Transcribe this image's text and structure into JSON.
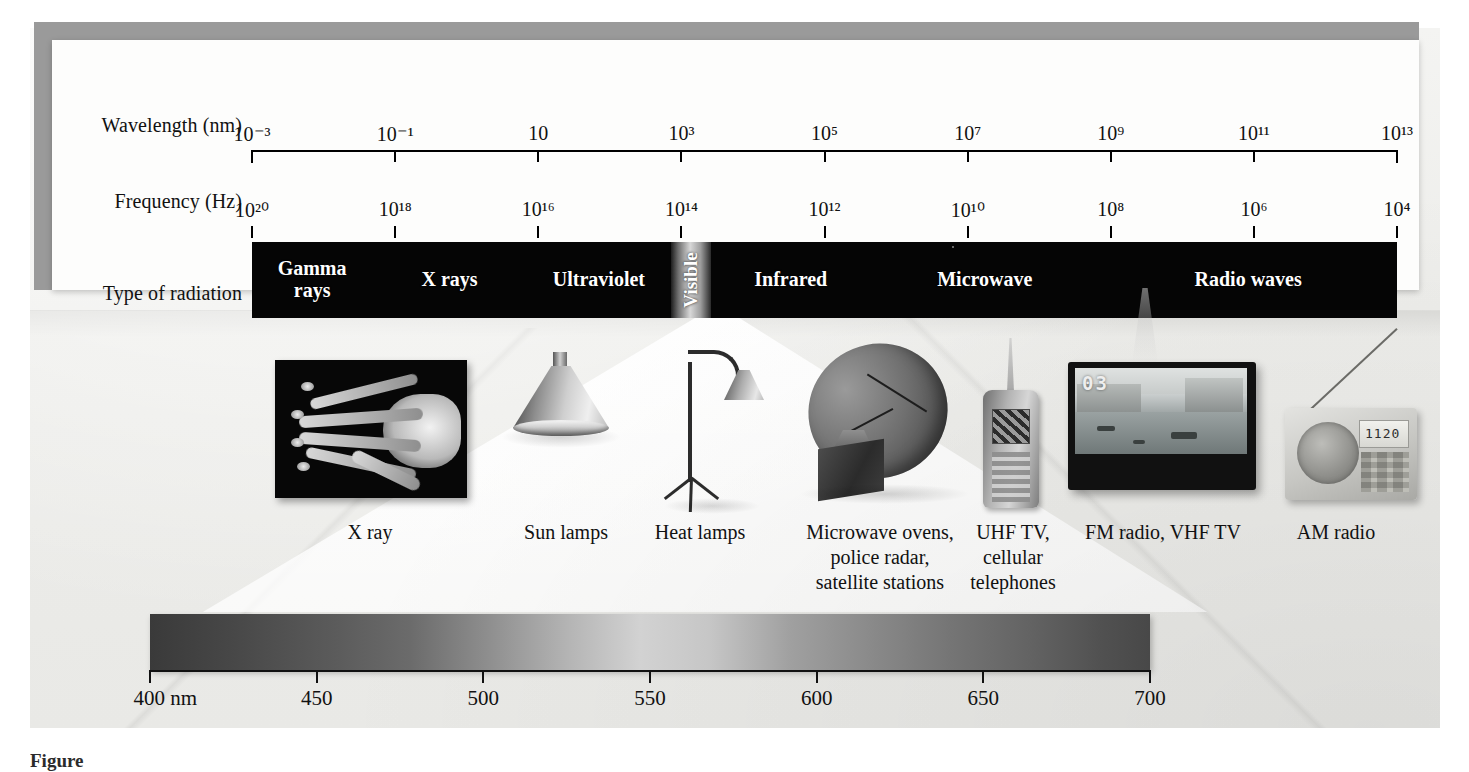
{
  "figure": {
    "caption_fragment": "Figure"
  },
  "axes": {
    "wavelength": {
      "label": "Wavelength (nm)",
      "ticks": [
        {
          "base": "10",
          "exp": "−3"
        },
        {
          "base": "10",
          "exp": "−1"
        },
        {
          "base": "10",
          "exp": ""
        },
        {
          "base": "10",
          "exp": "3"
        },
        {
          "base": "10",
          "exp": "5"
        },
        {
          "base": "10",
          "exp": "7"
        },
        {
          "base": "10",
          "exp": "9"
        },
        {
          "base": "10",
          "exp": "11"
        },
        {
          "base": "10",
          "exp": "13"
        }
      ],
      "tick_text": [
        "10⁻³",
        "10⁻¹",
        "10",
        "10³",
        "10⁵",
        "10⁷",
        "10⁹",
        "10¹¹",
        "10¹³"
      ]
    },
    "frequency": {
      "label": "Frequency (Hz)",
      "tick_text": [
        "10²⁰",
        "10¹⁸",
        "10¹⁶",
        "10¹⁴",
        "10¹²",
        "10¹⁰",
        "10⁸",
        "10⁶",
        "10⁴"
      ]
    },
    "type_of_radiation": {
      "label": "Type of radiation"
    }
  },
  "bands": [
    {
      "name": "Gamma rays",
      "label": "Gamma\nrays"
    },
    {
      "name": "X rays",
      "label": "X rays"
    },
    {
      "name": "Ultraviolet",
      "label": "Ultraviolet"
    },
    {
      "name": "Visible",
      "label": "Visible"
    },
    {
      "name": "Infrared",
      "label": "Infrared"
    },
    {
      "name": "Microwave",
      "label": "Microwave"
    },
    {
      "name": "Radio waves",
      "label": "Radio waves"
    }
  ],
  "devices": [
    {
      "name": "x-ray",
      "caption": "X ray"
    },
    {
      "name": "sun-lamp",
      "caption": "Sun lamps"
    },
    {
      "name": "heat-lamp",
      "caption": "Heat lamps"
    },
    {
      "name": "satellite-dish",
      "caption": "Microwave ovens,\npolice radar,\nsatellite stations"
    },
    {
      "name": "cell-phone",
      "caption": "UHF TV,\ncellular\ntelephones"
    },
    {
      "name": "television",
      "caption": "FM radio, VHF TV"
    },
    {
      "name": "am-radio",
      "caption": "AM radio"
    }
  ],
  "screens": {
    "tv_channel": "03",
    "radio_frequency": "1120"
  },
  "visible_spectrum": {
    "unit": "nm",
    "tick_labels": [
      "400 nm",
      "450",
      "500",
      "550",
      "600",
      "650",
      "700"
    ],
    "range": [
      400,
      700
    ]
  },
  "chart_data": {
    "type": "bar",
    "xlabel": "Wavelength (nm) / Frequency (Hz)",
    "ylabel": "Type of radiation",
    "categories": [
      "Gamma rays",
      "X rays",
      "Ultraviolet",
      "Visible",
      "Infrared",
      "Microwave",
      "Radio waves"
    ],
    "values": [
      1,
      1,
      1,
      1,
      1,
      1,
      1
    ],
    "wavelength_axis_nm": [
      0.001,
      0.1,
      10,
      1000,
      100000,
      10000000,
      1000000000,
      100000000000,
      10000000000000
    ],
    "frequency_axis_hz": [
      1e+20,
      1e+18,
      1e+16,
      100000000000000.0,
      1000000000000.0,
      10000000000.0,
      100000000.0,
      1000000.0,
      10000.0
    ],
    "band_spans_pct": [
      {
        "name": "Gamma rays",
        "start": 0.0,
        "end": 10.5
      },
      {
        "name": "X rays",
        "start": 10.5,
        "end": 24.0
      },
      {
        "name": "Ultraviolet",
        "start": 24.0,
        "end": 36.6
      },
      {
        "name": "Visible",
        "start": 36.6,
        "end": 40.1
      },
      {
        "name": "Infrared",
        "start": 40.1,
        "end": 54.0
      },
      {
        "name": "Microwave",
        "start": 54.0,
        "end": 74.0
      },
      {
        "name": "Radio waves",
        "start": 74.0,
        "end": 100.0
      }
    ],
    "visible_nm": [
      400,
      450,
      500,
      550,
      600,
      650,
      700
    ],
    "grid": false,
    "legend": "none"
  },
  "colors": {
    "band_background": "#050505",
    "band_text": "#ffffff",
    "panel_background": "#fdfdfc",
    "scene_background": "#ededea",
    "axis": "#000000"
  }
}
